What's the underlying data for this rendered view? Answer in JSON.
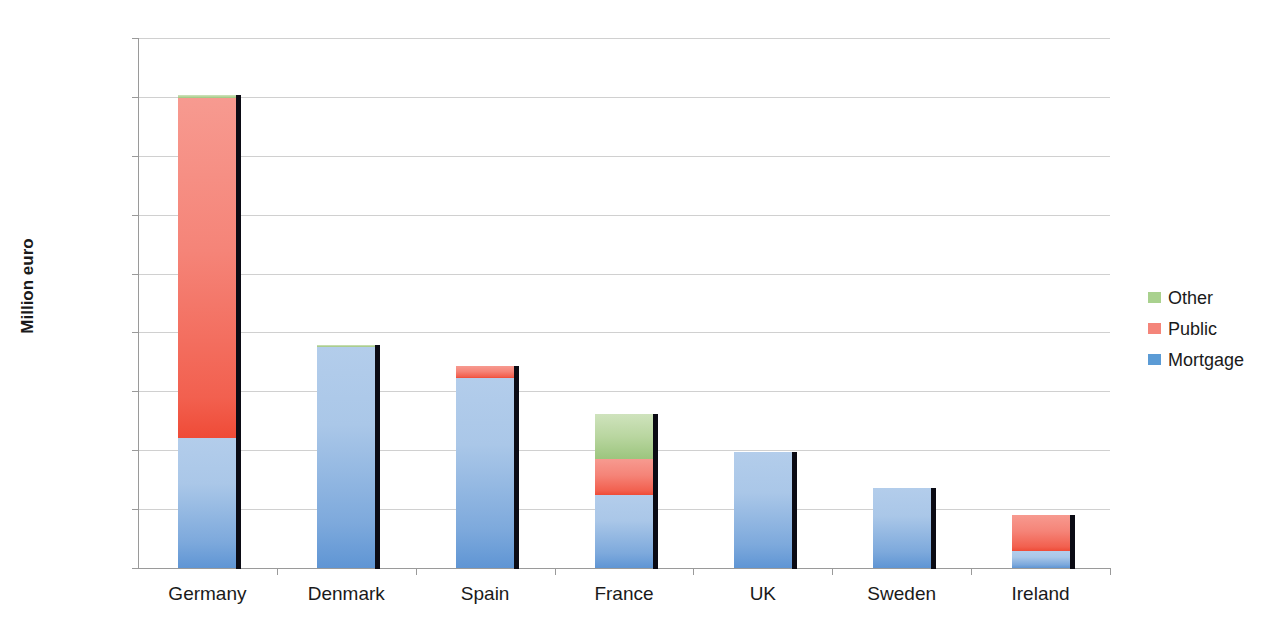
{
  "chart_data": {
    "type": "bar",
    "stacked": true,
    "title": "",
    "xlabel": "",
    "ylabel": "Million euro",
    "ylim": [
      0,
      900000
    ],
    "ytick_step": 100000,
    "ytick_labels": [
      "900000",
      "800000",
      "700000",
      "600000",
      "500000",
      "400000",
      "300000",
      "200000",
      "100000",
      "0"
    ],
    "ytick_values": [
      900000,
      800000,
      700000,
      600000,
      500000,
      400000,
      300000,
      200000,
      100000,
      0
    ],
    "grid": true,
    "legend_position": "right",
    "categories": [
      "Germany",
      "Denmark",
      "Spain",
      "France",
      "UK",
      "Sweden",
      "Ireland"
    ],
    "series": [
      {
        "name": "Mortgage",
        "color": "#5b9bd5",
        "values": [
          220000,
          375000,
          323000,
          124000,
          197000,
          136000,
          29000
        ]
      },
      {
        "name": "Public",
        "color": "#f4857a",
        "values": [
          578000,
          0,
          20000,
          61000,
          0,
          0,
          61000
        ]
      },
      {
        "name": "Other",
        "color": "#a9d18e",
        "values": [
          5000,
          3000,
          0,
          77000,
          0,
          0,
          0
        ]
      }
    ],
    "totals": [
      803000,
      378000,
      343000,
      262000,
      197000,
      136000,
      90000
    ]
  },
  "legend": {
    "items": [
      {
        "label": "Other",
        "color": "#a9d18e"
      },
      {
        "label": "Public",
        "color": "#f4857a"
      },
      {
        "label": "Mortgage",
        "color": "#5b9bd5"
      }
    ]
  }
}
